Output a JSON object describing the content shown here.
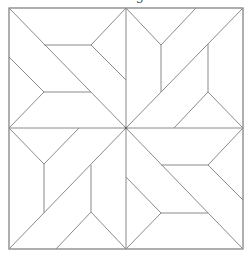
{
  "diagram": {
    "kind": "quilt-block-pattern",
    "caption_fragment": "g",
    "line_color": "#8a8a8a",
    "background": "#ffffff",
    "frame": {
      "x": 9,
      "y": 8,
      "width": 234,
      "height": 241
    },
    "center": {
      "x": 126,
      "y": 128
    },
    "symmetry": "4-fold rotational",
    "quadrants": [
      {
        "name": "top-left",
        "description": "diagonal from corner to center with two horizontal bars and chevron ends"
      },
      {
        "name": "top-right",
        "description": "diagonal from center to corner with two vertical bars and chevron ends"
      },
      {
        "name": "bottom-right",
        "description": "diagonal from center to corner with two horizontal bars and chevron ends"
      },
      {
        "name": "bottom-left",
        "description": "diagonal from corner to center with two vertical bars and chevron ends"
      }
    ]
  }
}
